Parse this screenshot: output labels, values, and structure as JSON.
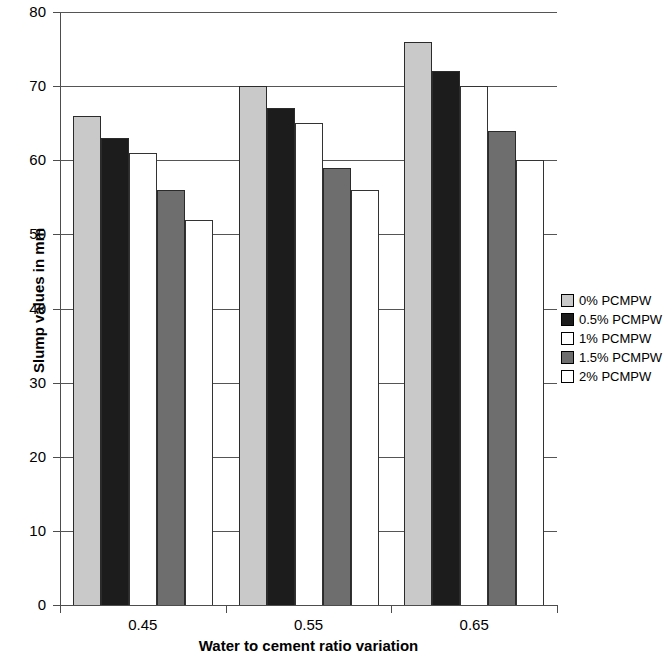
{
  "chart_data": {
    "type": "bar",
    "title": "",
    "xlabel": "Water to cement ratio variation",
    "ylabel": "Slump values in mm",
    "categories": [
      "0.45",
      "0.55",
      "0.65"
    ],
    "ylim": [
      0,
      80
    ],
    "yticks": [
      0,
      10,
      20,
      30,
      40,
      50,
      60,
      70,
      80
    ],
    "ytick_labels": [
      "0",
      "10",
      "20",
      "30",
      "40",
      "50",
      "60",
      "70",
      "80"
    ],
    "grid": true,
    "legend_position": "right",
    "series": [
      {
        "name": "0% PCMPW",
        "color": "#c9c9c9",
        "values": [
          66,
          70,
          76
        ]
      },
      {
        "name": "0.5% PCMPW",
        "color": "#1c1c1c",
        "values": [
          63,
          67,
          72
        ]
      },
      {
        "name": "1% PCMPW",
        "color": "#ffffff",
        "values": [
          61,
          65,
          70
        ]
      },
      {
        "name": "1.5% PCMPW",
        "color": "#6e6e6e",
        "values": [
          56,
          59,
          64
        ]
      },
      {
        "name": "2% PCMPW",
        "color": "#ffffff",
        "values": [
          52,
          56,
          60
        ]
      }
    ]
  },
  "axes": {
    "y_title": "Slump values in mm",
    "x_title": "Water to cement ratio variation"
  },
  "legend": {
    "items": [
      {
        "label": "0% PCMPW"
      },
      {
        "label": "0.5% PCMPW"
      },
      {
        "label": "1% PCMPW"
      },
      {
        "label": "1.5% PCMPW"
      },
      {
        "label": "2% PCMPW"
      }
    ]
  }
}
